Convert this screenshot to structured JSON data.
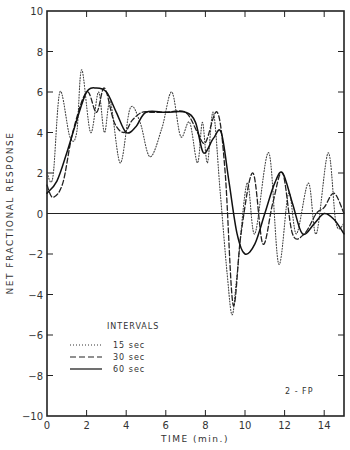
{
  "chart_data": {
    "type": "line",
    "title": "",
    "xlabel": "TIME (min.)",
    "ylabel": "NET FRACTIONAL RESPONSE",
    "xlim": [
      0,
      15
    ],
    "ylim": [
      -10,
      10
    ],
    "x_ticks": [
      0,
      2,
      4,
      6,
      8,
      10,
      12,
      14
    ],
    "y_ticks": [
      -10,
      -8,
      -6,
      -4,
      -2,
      0,
      2,
      4,
      6,
      8,
      10
    ],
    "x_tick_labels": [
      "0",
      "2",
      "4",
      "6",
      "8",
      "10",
      "12",
      "14"
    ],
    "y_tick_labels": [
      "-10",
      "-8",
      "-6",
      "-4",
      "-2",
      "0",
      "2",
      "4",
      "6",
      "8",
      "10"
    ],
    "grid": false,
    "zero_line": true,
    "annotation": "2 - FP",
    "legend": {
      "title": "INTERVALS",
      "position": "lower-left",
      "entries": [
        "15 sec",
        "30 sec",
        "60 sec"
      ]
    },
    "series": [
      {
        "name": "15 sec",
        "style": "dotted",
        "x": [
          0,
          0.3,
          0.65,
          1.15,
          1.5,
          1.75,
          2.2,
          2.6,
          2.9,
          3.2,
          3.7,
          4.2,
          4.7,
          5.2,
          5.8,
          6.3,
          6.75,
          7.2,
          7.6,
          7.85,
          8.1,
          8.4,
          8.75,
          9.1,
          9.35,
          9.6,
          10.1,
          10.5,
          11.2,
          11.7,
          12.2,
          12.6,
          13.2,
          13.6,
          14.2,
          14.6,
          15
        ],
        "y": [
          2,
          1.8,
          6,
          3.8,
          4,
          7.1,
          4,
          6,
          4,
          5.5,
          2.5,
          5.2,
          4.5,
          2.8,
          4.2,
          6,
          3.8,
          4.5,
          2.5,
          4.5,
          2.5,
          5,
          1,
          -3,
          -5,
          -3,
          1.5,
          -1,
          3,
          -2.5,
          1,
          -1,
          1.5,
          -1,
          3,
          -0.5,
          -0.5
        ]
      },
      {
        "name": "30 sec",
        "style": "dashed",
        "x": [
          0,
          0.3,
          0.8,
          1.3,
          2.0,
          2.5,
          2.9,
          3.4,
          3.9,
          4.3,
          4.8,
          5.3,
          6.0,
          7.0,
          7.6,
          8.0,
          8.6,
          9.0,
          9.4,
          9.8,
          10.4,
          10.9,
          11.4,
          11.9,
          12.4,
          13.0,
          13.6,
          14.0,
          14.5,
          15
        ],
        "y": [
          1.4,
          0.8,
          1.5,
          4,
          6,
          5,
          6.2,
          4.5,
          4,
          4.6,
          5,
          5,
          5,
          5,
          4,
          3.5,
          5,
          2,
          -4.5,
          -1,
          2,
          -1.5,
          0.5,
          2,
          -1,
          -1,
          0,
          0.3,
          1,
          0
        ]
      },
      {
        "name": "60 sec",
        "style": "solid",
        "x": [
          0,
          0.5,
          1.0,
          1.5,
          2.0,
          2.5,
          3.0,
          3.5,
          4.0,
          4.5,
          5.0,
          6.0,
          7.0,
          7.5,
          7.9,
          8.4,
          8.8,
          9.2,
          9.6,
          10.0,
          10.5,
          11.0,
          11.5,
          11.9,
          12.4,
          12.9,
          13.5,
          14.0,
          14.5,
          15
        ],
        "y": [
          1,
          1.6,
          3,
          4.6,
          6,
          6.2,
          6,
          5,
          4,
          4.3,
          5,
          5,
          5,
          4.5,
          3,
          3.7,
          4,
          1.5,
          -1,
          -2,
          -1.5,
          0,
          1.5,
          2,
          0.5,
          -1,
          -0.5,
          0,
          -0.3,
          -1
        ]
      }
    ]
  }
}
